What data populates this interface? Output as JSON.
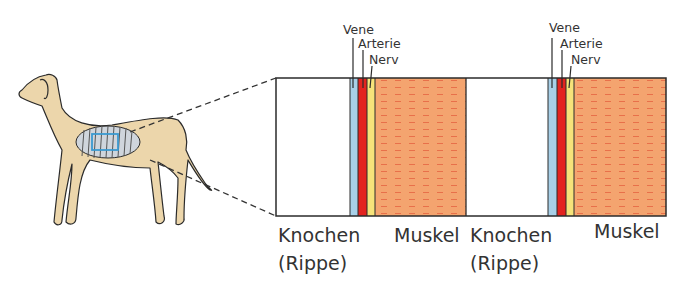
{
  "figure": {
    "zoom_region": "chest-wall-between-ribs",
    "panels": [
      {
        "id": "panel-1",
        "layers": [
          {
            "name": "Knochen (Rippe)",
            "color": "#ffffff"
          },
          {
            "name": "Vene",
            "color": "#a8d0e8"
          },
          {
            "name": "Arterie",
            "color": "#e3231f"
          },
          {
            "name": "Nerv",
            "color": "#f6e37a"
          },
          {
            "name": "Muskel",
            "color": "#f4a46f"
          }
        ],
        "top_labels": {
          "vein": "Vene",
          "artery": "Arterie",
          "nerve": "Nerv"
        },
        "bottom_labels": {
          "bone_line1": "Knochen",
          "bone_line2": "(Rippe)",
          "muscle": "Muskel"
        }
      },
      {
        "id": "panel-2",
        "layers": [
          {
            "name": "Knochen (Rippe)",
            "color": "#ffffff"
          },
          {
            "name": "Vene",
            "color": "#a8d0e8"
          },
          {
            "name": "Arterie",
            "color": "#e3231f"
          },
          {
            "name": "Nerv",
            "color": "#f6e37a"
          },
          {
            "name": "Muskel",
            "color": "#f4a46f"
          }
        ],
        "top_labels": {
          "vein": "Vene",
          "artery": "Arterie",
          "nerve": "Nerv"
        },
        "bottom_labels": {
          "bone_line1": "Knochen",
          "bone_line2": "(Rippe)",
          "muscle": "Muskel"
        }
      }
    ],
    "colors": {
      "dog_fill": "#ecd6ab",
      "outline": "#2b2b2b",
      "highlight_box": "#3a9ad0",
      "muscle_stripe": "#e8704a"
    }
  }
}
